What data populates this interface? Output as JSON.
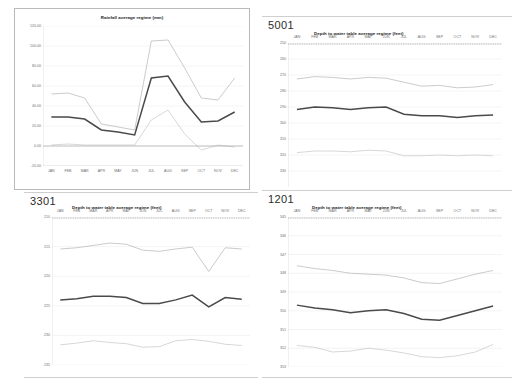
{
  "page": {
    "background": "#ffffff",
    "panel_count": 4
  },
  "months": [
    "JAN",
    "FEB",
    "MAR",
    "APR",
    "MAY",
    "JUN",
    "JUL",
    "AUG",
    "SEP",
    "OCT",
    "NOV",
    "DEC"
  ],
  "colors": {
    "main_series": "#4a4a4a",
    "upper_series": "#b5b5b5",
    "lower_series": "#c6c6c6",
    "grid": "#e4e4e4",
    "axis": "#c4c4c4",
    "text": "#6f6f6f",
    "title": "#1a1a1a"
  },
  "panels": {
    "rainfall": {
      "well_id": "",
      "title": "Rainfall average regime (mm)"
    },
    "well_5001": {
      "well_id": "5001",
      "title": "Depth to water table average regime (feet)"
    },
    "well_3301": {
      "well_id": "3301",
      "title": "Depth to water table average regime (feet)"
    },
    "well_1201": {
      "well_id": "1201",
      "title": "Depth to water table average regime (feet)"
    }
  },
  "chart_data": [
    {
      "id": "rainfall",
      "type": "line",
      "title": "Rainfall average regime (mm)",
      "xlabel": "",
      "ylabel": "",
      "categories": [
        "JAN",
        "FEB",
        "MAR",
        "APR",
        "MAY",
        "JUN",
        "JUL",
        "AUG",
        "SEP",
        "OCT",
        "NOV",
        "DEC"
      ],
      "ylim": [
        -20,
        120
      ],
      "yticks": [
        "120.00",
        "100.00",
        "80.00",
        "60.00",
        "40.00",
        "20.00",
        "0.00",
        "-20.00"
      ],
      "ytick_values": [
        120,
        100,
        80,
        60,
        40,
        20,
        0,
        -20
      ],
      "grid": true,
      "legend": "none",
      "series": [
        {
          "name": "upper",
          "style": "light",
          "values": [
            52,
            53,
            48,
            22,
            19,
            16,
            105,
            106,
            78,
            48,
            46,
            68
          ]
        },
        {
          "name": "average",
          "style": "bold",
          "values": [
            29,
            29,
            27,
            16,
            14,
            11,
            68,
            70,
            44,
            24,
            25,
            34
          ]
        },
        {
          "name": "lower",
          "style": "light",
          "values": [
            1,
            2,
            1,
            1,
            1,
            1,
            26,
            36,
            12,
            -4,
            1,
            -1
          ]
        }
      ]
    },
    {
      "id": "well_5001",
      "type": "line",
      "title": "Depth to water table average regime (feet)",
      "well_id": "5001",
      "xlabel": "",
      "ylabel": "",
      "categories": [
        "JAN",
        "FEB",
        "MAR",
        "APR",
        "MAY",
        "JUN",
        "JUL",
        "AUG",
        "SEP",
        "OCT",
        "NOV",
        "DEC"
      ],
      "ylim": [
        250,
        340
      ],
      "y_inverted": true,
      "yticks": [
        "250",
        "260",
        "270",
        "280",
        "290",
        "300",
        "310",
        "320",
        "330"
      ],
      "ytick_values": [
        250,
        260,
        270,
        280,
        290,
        300,
        310,
        320,
        330
      ],
      "grid": true,
      "legend": "none",
      "series": [
        {
          "name": "shallow",
          "style": "light",
          "values": [
            272.5,
            271.0,
            271.5,
            272.5,
            271.5,
            272.0,
            274.5,
            277.0,
            276.5,
            278.0,
            277.5,
            276.0
          ]
        },
        {
          "name": "average",
          "style": "bold",
          "values": [
            291.5,
            290.0,
            290.5,
            291.5,
            290.5,
            290.0,
            294.5,
            295.5,
            295.5,
            296.5,
            295.5,
            295.0
          ]
        },
        {
          "name": "deep",
          "style": "light",
          "values": [
            318.5,
            317.5,
            317.5,
            318.0,
            317.0,
            317.5,
            320.5,
            320.5,
            320.0,
            320.5,
            320.0,
            320.5
          ]
        }
      ]
    },
    {
      "id": "well_3301",
      "type": "line",
      "title": "Depth to water table average regime (feet)",
      "well_id": "3301",
      "xlabel": "",
      "ylabel": "",
      "categories": [
        "JAN",
        "FEB",
        "MAR",
        "APR",
        "MAY",
        "JUN",
        "JUL",
        "AUG",
        "SEP",
        "OCT",
        "NOV",
        "DEC"
      ],
      "ylim": [
        210,
        235
      ],
      "y_inverted": true,
      "yticks": [
        "210",
        "215",
        "220",
        "225",
        "230",
        "235"
      ],
      "ytick_values": [
        210,
        215,
        220,
        225,
        230,
        235
      ],
      "grid": true,
      "legend": "none",
      "series": [
        {
          "name": "shallow",
          "style": "light",
          "values": [
            215.4,
            215.2,
            214.8,
            214.4,
            214.6,
            215.6,
            215.8,
            215.4,
            215.1,
            219.2,
            215.2,
            215.4
          ]
        },
        {
          "name": "average",
          "style": "bold",
          "values": [
            224.0,
            223.8,
            223.4,
            223.4,
            223.6,
            224.6,
            224.6,
            224.0,
            223.2,
            225.2,
            223.6,
            223.9
          ]
        },
        {
          "name": "deep",
          "style": "light",
          "values": [
            231.6,
            231.3,
            230.9,
            231.2,
            231.4,
            232.0,
            231.9,
            230.9,
            230.7,
            231.0,
            231.5,
            231.7
          ]
        }
      ]
    },
    {
      "id": "well_1201",
      "type": "line",
      "title": "Depth to water table average regime (feet)",
      "well_id": "1201",
      "xlabel": "",
      "ylabel": "",
      "categories": [
        "JAN",
        "FEB",
        "MAR",
        "APR",
        "MAY",
        "JUN",
        "JUL",
        "AUG",
        "SEP",
        "OCT",
        "NOV",
        "DEC"
      ],
      "ylim": [
        345,
        353
      ],
      "y_inverted": true,
      "yticks": [
        "345",
        "346",
        "347",
        "348",
        "349",
        "350",
        "351",
        "352",
        "353"
      ],
      "ytick_values": [
        345,
        346,
        347,
        348,
        349,
        350,
        351,
        352,
        353
      ],
      "grid": true,
      "legend": "none",
      "series": [
        {
          "name": "shallow",
          "style": "light",
          "values": [
            347.6,
            347.75,
            347.85,
            348.0,
            348.05,
            348.1,
            348.25,
            348.5,
            348.55,
            348.3,
            348.05,
            347.85
          ]
        },
        {
          "name": "average",
          "style": "bold",
          "values": [
            349.7,
            349.85,
            349.95,
            350.1,
            350.0,
            349.95,
            350.15,
            350.45,
            350.5,
            350.25,
            350.0,
            349.75
          ]
        },
        {
          "name": "deep",
          "style": "light",
          "values": [
            351.85,
            351.95,
            352.2,
            352.15,
            352.0,
            352.1,
            352.25,
            352.45,
            352.5,
            352.4,
            352.2,
            351.8
          ]
        }
      ]
    }
  ]
}
